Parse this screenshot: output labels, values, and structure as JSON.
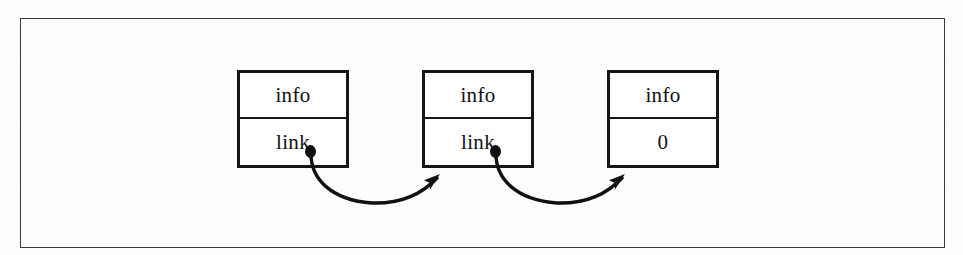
{
  "figure": {
    "type": "linked-list-diagram",
    "background_color": "#fdfdfd",
    "border_color": "#3a3a3c",
    "ink_color": "#16161a"
  },
  "nodes": [
    {
      "id": "node-1",
      "index": 1,
      "info_label": "info",
      "link_label": "link",
      "link_kind": "pointer",
      "has_pointer_dot": true
    },
    {
      "id": "node-2",
      "index": 2,
      "info_label": "info",
      "link_label": "link",
      "link_kind": "pointer",
      "has_pointer_dot": true
    },
    {
      "id": "node-3",
      "index": 3,
      "info_label": "info",
      "link_label": "0",
      "link_kind": "null",
      "has_pointer_dot": false
    }
  ],
  "arrows": [
    {
      "id": "arrow-1",
      "from_node": "node-1",
      "to_node": "node-2",
      "style": "curved-arc-below",
      "arrowhead": "filled-triangle"
    },
    {
      "id": "arrow-2",
      "from_node": "node-2",
      "to_node": "node-3",
      "style": "curved-arc-below",
      "arrowhead": "filled-triangle"
    }
  ]
}
